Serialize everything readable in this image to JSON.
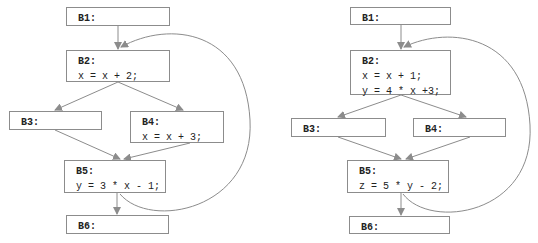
{
  "diagrams": [
    {
      "name": "left-cfg",
      "blocks": [
        {
          "id": "B1",
          "label": "B1:",
          "statements": []
        },
        {
          "id": "B2",
          "label": "B2:",
          "statements": [
            "x = x + 2;"
          ]
        },
        {
          "id": "B3",
          "label": "B3:",
          "statements": []
        },
        {
          "id": "B4",
          "label": "B4:",
          "statements": [
            "x = x + 3;"
          ]
        },
        {
          "id": "B5",
          "label": "B5:",
          "statements": [
            "y = 3 * x - 1;"
          ]
        },
        {
          "id": "B6",
          "label": "B6:",
          "statements": []
        }
      ],
      "edges": [
        [
          "B1",
          "B2"
        ],
        [
          "B2",
          "B3"
        ],
        [
          "B2",
          "B4"
        ],
        [
          "B3",
          "B5"
        ],
        [
          "B4",
          "B5"
        ],
        [
          "B5",
          "B6"
        ],
        [
          "B5",
          "B2"
        ]
      ]
    },
    {
      "name": "right-cfg",
      "blocks": [
        {
          "id": "B1",
          "label": "B1:",
          "statements": []
        },
        {
          "id": "B2",
          "label": "B2:",
          "statements": [
            "x = x + 1;",
            "y = 4 * x +3;"
          ]
        },
        {
          "id": "B3",
          "label": "B3:",
          "statements": []
        },
        {
          "id": "B4",
          "label": "B4:",
          "statements": []
        },
        {
          "id": "B5",
          "label": "B5:",
          "statements": [
            "z = 5 * y - 2;"
          ]
        },
        {
          "id": "B6",
          "label": "B6:",
          "statements": []
        }
      ],
      "edges": [
        [
          "B1",
          "B2"
        ],
        [
          "B2",
          "B3"
        ],
        [
          "B2",
          "B4"
        ],
        [
          "B3",
          "B5"
        ],
        [
          "B4",
          "B5"
        ],
        [
          "B5",
          "B6"
        ],
        [
          "B5",
          "B2"
        ]
      ]
    }
  ],
  "colors": {
    "edge": "#8c8c8c",
    "border": "#8c8c8c",
    "text": "#222222"
  }
}
